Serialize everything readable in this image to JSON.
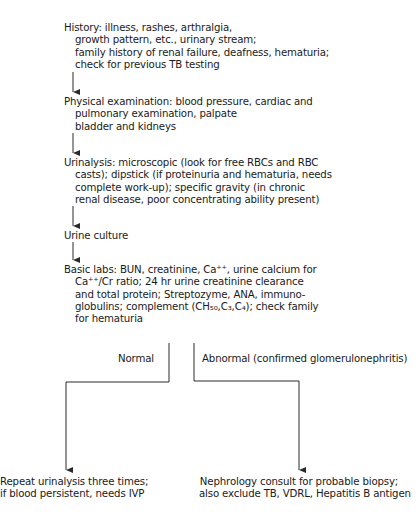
{
  "steps": [
    {
      "id": "history",
      "lines": [
        "History: illness, rashes, arthralgia,",
        "growth pattern, etc., urinary stream;",
        "family history of renal failure, deafness, hematuria;",
        "check for previous TB testing"
      ]
    },
    {
      "id": "physical-exam",
      "lines": [
        "Physical examination: blood pressure, cardiac and",
        "pulmonary examination, palpate",
        "bladder and kidneys"
      ]
    },
    {
      "id": "urinalysis",
      "lines": [
        "Urinalysis: microscopic (look for free RBCs and RBC",
        "casts); dipstick (if proteinuria and  hematuria, needs",
        "complete work-up); specific gravity (in chronic",
        "renal disease, poor concentrating ability present)"
      ]
    },
    {
      "id": "urine-culture",
      "lines": [
        "Urine culture"
      ]
    },
    {
      "id": "basic-labs",
      "lines": [
        "Basic labs: BUN, creatinine, Ca⁺⁺, urine calcium for",
        "Ca⁺⁺/Cr ratio; 24 hr urine creatinine clearance",
        "and total protein; Streptozyme, ANA, immuno-",
        "globulins; complement (CH₅₀,C₃,C₄); check family",
        "for hematuria"
      ]
    }
  ],
  "branches": {
    "normal": {
      "label": "Normal",
      "outcome": [
        "Repeat urinalysis three times;",
        "if blood persistent, needs IVP"
      ]
    },
    "abnormal": {
      "label": "Abnormal (confirmed glomerulonephritis)",
      "outcome": [
        "Nephrology consult for probable biopsy;",
        "also exclude TB, VDRL, Hepatitis B antigen"
      ]
    }
  },
  "colors": {
    "text": "#1a1a1a",
    "line": "#2a2a2a",
    "background": "#ffffff"
  }
}
